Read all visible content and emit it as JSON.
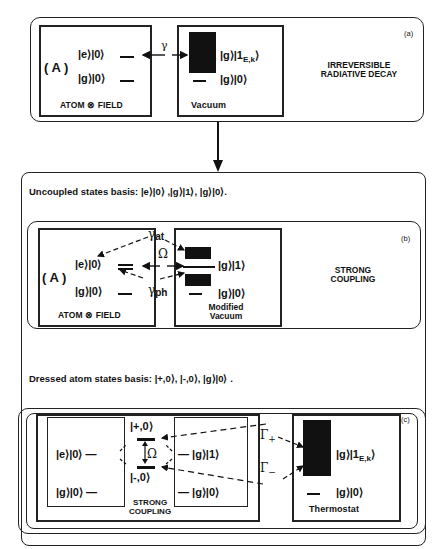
{
  "panel_a": {
    "tag": "(a)",
    "system_label": "( A )",
    "left_box": {
      "caption": "ATOM ⊗ FIELD",
      "levels": [
        "|e⟩|0⟩",
        "|g⟩|0⟩"
      ]
    },
    "coupling_symbol": "γ",
    "right_box": {
      "caption": "Vacuum",
      "levels": [
        "|g⟩|1",
        "|g⟩|0⟩"
      ],
      "subscript": "E,k",
      "continuum_close": "⟩"
    },
    "description_line1": "IRREVERSIBLE",
    "description_line2": "RADIATIVE DECAY"
  },
  "section_b_heading": "Uncoupled states basis: |e⟩|0⟩ ,|g⟩|1⟩, |g⟩|0⟩.",
  "panel_b": {
    "tag": "(b)",
    "system_label": "( A )",
    "left_box": {
      "caption": "ATOM ⊗ FIELD",
      "levels": [
        "|e⟩|0⟩",
        "|g⟩|0⟩"
      ]
    },
    "gamma_at": "γ",
    "gamma_at_sub": "at",
    "omega": "Ω",
    "gamma_ph": "γ",
    "gamma_ph_sub": "ph",
    "right_box": {
      "caption_line1": "Modified",
      "caption_line2": "Vacuum",
      "levels": [
        "|g⟩|1⟩",
        "|g⟩|0⟩"
      ]
    },
    "description_line1": "STRONG",
    "description_line2": "COUPLING"
  },
  "section_c_heading": "Dressed atom states basis: |+,0⟩, |-,0⟩, |g⟩|0⟩ .",
  "panel_c": {
    "tag": "(c)",
    "left_box": {
      "levels": [
        "|e⟩|0⟩ —",
        "|g⟩|0⟩ —"
      ]
    },
    "dressed_plus": "|+,0⟩",
    "dressed_minus": "|-,0⟩",
    "omega": "Ω",
    "middle_box": {
      "levels": [
        "— |g⟩|1⟩",
        "— |g⟩|0⟩"
      ]
    },
    "strong_coupling_line1": "STRONG",
    "strong_coupling_line2": "COUPLING",
    "gamma_plus": "Γ",
    "gamma_plus_sub": "+",
    "gamma_minus": "Γ",
    "gamma_minus_sub": "−",
    "thermostat": {
      "caption": "Thermostat",
      "levels": [
        "|g⟩|1",
        "|g⟩|0⟩"
      ],
      "subscript": "E,k",
      "continuum_close": "⟩"
    }
  }
}
